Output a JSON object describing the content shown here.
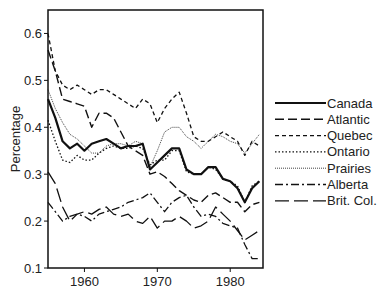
{
  "chart_data": {
    "type": "line",
    "title": "",
    "xlabel": "",
    "ylabel": "Percentage",
    "xlim": [
      1955,
      1984.5
    ],
    "ylim": [
      0.1,
      0.65
    ],
    "xticks": [
      1960,
      1970,
      1980
    ],
    "yticks": [
      0.1,
      0.2,
      0.3,
      0.4,
      0.5,
      0.6
    ],
    "ytick_labels": [
      "0.1",
      "0.2",
      "0.3",
      "0.4",
      "0.5",
      "0.6"
    ],
    "xtick_labels": [
      "1960",
      "1970",
      "1980"
    ],
    "grid": false,
    "legend_position": "right",
    "x": [
      1955,
      1956,
      1957,
      1958,
      1959,
      1960,
      1961,
      1962,
      1963,
      1964,
      1965,
      1966,
      1967,
      1968,
      1969,
      1970,
      1971,
      1972,
      1973,
      1974,
      1975,
      1976,
      1977,
      1978,
      1979,
      1980,
      1981,
      1982,
      1983,
      1984
    ],
    "series": [
      {
        "name": "Canada",
        "style": "solid-thick",
        "values": [
          0.46,
          0.42,
          0.37,
          0.355,
          0.365,
          0.35,
          0.365,
          0.37,
          0.375,
          0.365,
          0.355,
          0.36,
          0.36,
          0.365,
          0.31,
          0.325,
          0.34,
          0.355,
          0.355,
          0.31,
          0.3,
          0.3,
          0.315,
          0.315,
          0.29,
          0.285,
          0.27,
          0.24,
          0.27,
          0.285
        ]
      },
      {
        "name": "Atlantic",
        "style": "long-dash",
        "values": [
          0.565,
          0.52,
          0.46,
          0.455,
          0.45,
          0.445,
          0.4,
          0.43,
          0.43,
          0.42,
          0.39,
          0.36,
          0.35,
          0.34,
          0.3,
          0.305,
          0.295,
          0.28,
          0.265,
          0.255,
          0.245,
          0.24,
          0.255,
          0.26,
          0.25,
          0.24,
          0.24,
          0.22,
          0.235,
          0.24
        ]
      },
      {
        "name": "Quebec",
        "style": "short-dash",
        "values": [
          0.6,
          0.52,
          0.49,
          0.48,
          0.49,
          0.48,
          0.47,
          0.48,
          0.48,
          0.47,
          0.46,
          0.45,
          0.44,
          0.46,
          0.45,
          0.41,
          0.44,
          0.46,
          0.475,
          0.43,
          0.38,
          0.37,
          0.37,
          0.38,
          0.39,
          0.38,
          0.37,
          0.34,
          0.37,
          0.36
        ]
      },
      {
        "name": "Ontario",
        "style": "dotted",
        "values": [
          0.415,
          0.37,
          0.33,
          0.325,
          0.34,
          0.33,
          0.33,
          0.345,
          0.355,
          0.36,
          0.355,
          0.355,
          0.36,
          0.355,
          0.32,
          0.33,
          0.33,
          0.35,
          0.35,
          0.305,
          0.3,
          0.3,
          0.315,
          0.31,
          0.29,
          0.285,
          0.275,
          0.24,
          0.275,
          0.285
        ]
      },
      {
        "name": "Prairies",
        "style": "fine-dotted",
        "values": [
          0.48,
          0.44,
          0.41,
          0.385,
          0.375,
          0.36,
          0.345,
          0.345,
          0.36,
          0.365,
          0.365,
          0.36,
          0.37,
          0.365,
          0.315,
          0.35,
          0.39,
          0.4,
          0.4,
          0.38,
          0.37,
          0.355,
          0.37,
          0.385,
          0.38,
          0.37,
          0.365,
          0.345,
          0.365,
          0.385
        ]
      },
      {
        "name": "Alberta",
        "style": "dash-dot",
        "values": [
          0.24,
          0.22,
          0.2,
          0.21,
          0.215,
          0.21,
          0.2,
          0.215,
          0.22,
          0.225,
          0.23,
          0.24,
          0.245,
          0.25,
          0.26,
          0.24,
          0.22,
          0.24,
          0.25,
          0.255,
          0.23,
          0.21,
          0.215,
          0.21,
          0.195,
          0.19,
          0.185,
          0.15,
          0.12,
          0.12
        ]
      },
      {
        "name": "Brit. Col.",
        "style": "long-dash-sparse",
        "values": [
          0.305,
          0.28,
          0.23,
          0.2,
          0.215,
          0.22,
          0.215,
          0.225,
          0.23,
          0.215,
          0.21,
          0.215,
          0.2,
          0.195,
          0.21,
          0.185,
          0.2,
          0.2,
          0.21,
          0.2,
          0.185,
          0.19,
          0.2,
          0.23,
          0.215,
          0.2,
          0.18,
          0.16,
          0.17,
          0.18
        ]
      }
    ]
  },
  "legend": {
    "items": [
      "Canada",
      "Atlantic",
      "Quebec",
      "Ontario",
      "Prairies",
      "Alberta",
      "Brit. Col."
    ]
  },
  "axes": {
    "ylabel": "Percentage"
  }
}
